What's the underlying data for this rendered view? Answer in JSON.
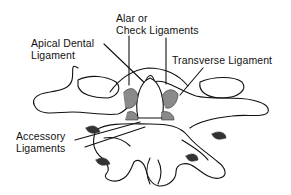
{
  "diagram": {
    "labels": {
      "alar": {
        "line1": "Alar or",
        "line2": "Check Ligaments"
      },
      "apical": {
        "line1": "Apical Dental",
        "line2": "Ligament"
      },
      "transverse": {
        "line1": "Transverse Ligament"
      },
      "accessory": {
        "line1": "Accessory",
        "line2": "Ligaments"
      }
    },
    "colors": {
      "ink": "#111111",
      "shade": "#8a8a8a",
      "background": "#ffffff"
    }
  }
}
